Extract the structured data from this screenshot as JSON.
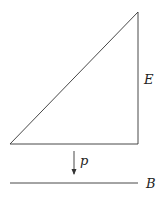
{
  "diagram": {
    "labels": {
      "total_space": "E",
      "projection": "p",
      "base_space": "B"
    },
    "colors": {
      "stroke": "#333333",
      "background": "#ffffff"
    }
  }
}
